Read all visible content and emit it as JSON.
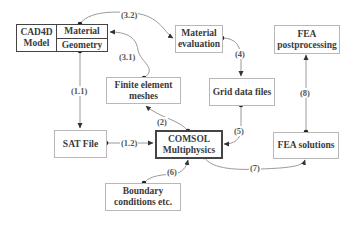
{
  "diagram": {
    "nodes": {
      "cad4d": {
        "label_line1": "CAD4D",
        "label_line2": "Model",
        "cell_material": "Material",
        "cell_geometry": "Geometry"
      },
      "material_evaluation": {
        "line1": "Material",
        "line2": "evaluation"
      },
      "fea_postprocessing": {
        "line1": "FEA",
        "line2": "postprocessing"
      },
      "finite_element_meshes": {
        "line1": "Finite element",
        "line2": "meshes"
      },
      "grid_data_files": {
        "line1": "Grid data files"
      },
      "sat_file": {
        "line1": "SAT File"
      },
      "comsol": {
        "line1": "COMSOL",
        "line2": "Multiphysics"
      },
      "fea_solutions": {
        "line1": "FEA solutions"
      },
      "boundary_conditions": {
        "line1": "Boundary",
        "line2": "conditions etc."
      }
    },
    "edges": {
      "e1_1": "(1.1)",
      "e1_2": "(1.2)",
      "e2": "(2)",
      "e3_1": "(3.1)",
      "e3_2": "(3.2)",
      "e4": "(4)",
      "e5": "(5)",
      "e6": "(6)",
      "e7": "(7)",
      "e8": "(8)"
    },
    "colors": {
      "line": "#9a9a9a",
      "dot": "#222222",
      "box_border": "#b8b8b8",
      "thick_border": "#444444"
    }
  }
}
